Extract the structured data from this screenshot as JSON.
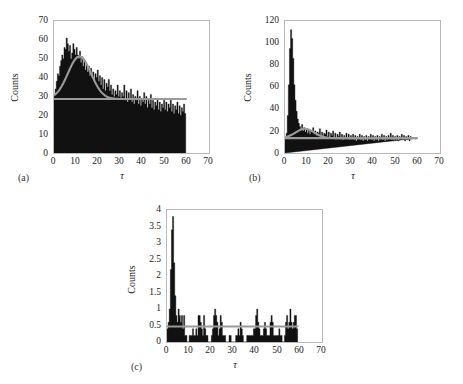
{
  "figure": {
    "background": "#ffffff",
    "fit_color": "#9a9a9a",
    "hist_color": "#111111",
    "axis_color": "#b9b9b9"
  },
  "panels": [
    {
      "id": "a",
      "label": "(a)",
      "ylabel": "Counts",
      "xlabel": "τ",
      "yticks": [
        "0",
        "10",
        "20",
        "30",
        "40",
        "50",
        "60",
        "70"
      ],
      "xticks": [
        "0",
        "10",
        "20",
        "30",
        "40",
        "50",
        "60",
        "70"
      ]
    },
    {
      "id": "b",
      "label": "(b)",
      "ylabel": "Counts",
      "xlabel": "τ",
      "yticks": [
        "0",
        "20",
        "40",
        "60",
        "80",
        "100",
        "120"
      ],
      "xticks": [
        "0",
        "10",
        "20",
        "30",
        "40",
        "50",
        "60",
        "70"
      ]
    },
    {
      "id": "c",
      "label": "(c)",
      "ylabel": "Counts",
      "xlabel": "τ",
      "yticks": [
        "0",
        "0.5",
        "1",
        "1.5",
        "2",
        "2.5",
        "3",
        "3.5",
        "4"
      ],
      "xticks": [
        "0",
        "10",
        "20",
        "30",
        "40",
        "50",
        "60",
        "70"
      ]
    }
  ],
  "chart_data": [
    {
      "type": "bar",
      "panel": "a",
      "title": "",
      "xlabel": "τ",
      "ylabel": "Counts",
      "xlim": [
        0,
        70
      ],
      "ylim": [
        0,
        70
      ],
      "grid": false,
      "legend": "none",
      "data_x_max": 59.5,
      "bin_width": 0.5,
      "x": [
        0.25,
        0.75,
        1.25,
        1.75,
        2.25,
        2.75,
        3.25,
        3.75,
        4.25,
        4.75,
        5.25,
        5.75,
        6.25,
        6.75,
        7.25,
        7.75,
        8.25,
        8.75,
        9.25,
        9.75,
        10.25,
        10.75,
        11.25,
        11.75,
        12.25,
        12.75,
        13.25,
        13.75,
        14.25,
        14.75,
        15.25,
        15.75,
        16.25,
        16.75,
        17.25,
        17.75,
        18.25,
        18.75,
        19.25,
        19.75,
        20.25,
        20.75,
        21.25,
        21.75,
        22.25,
        22.75,
        23.25,
        23.75,
        24.25,
        24.75,
        25.25,
        25.75,
        26.25,
        26.75,
        27.25,
        27.75,
        28.25,
        28.75,
        29.25,
        29.75,
        30.25,
        30.75,
        31.25,
        31.75,
        32.25,
        32.75,
        33.25,
        33.75,
        34.25,
        34.75,
        35.25,
        35.75,
        36.25,
        36.75,
        37.25,
        37.75,
        38.25,
        38.75,
        39.25,
        39.75,
        40.25,
        40.75,
        41.25,
        41.75,
        42.25,
        42.75,
        43.25,
        43.75,
        44.25,
        44.75,
        45.25,
        45.75,
        46.25,
        46.75,
        47.25,
        47.75,
        48.25,
        48.75,
        49.25,
        49.75,
        50.25,
        50.75,
        51.25,
        51.75,
        52.25,
        52.75,
        53.25,
        53.75,
        54.25,
        54.75,
        55.25,
        55.75,
        56.25,
        56.75,
        57.25,
        57.75,
        58.25,
        58.75,
        59.25
      ],
      "values": [
        31,
        34,
        38,
        42,
        41,
        46,
        49,
        52,
        50,
        56,
        55,
        61,
        58,
        54,
        57,
        50,
        53,
        58,
        55,
        52,
        56,
        52,
        50,
        54,
        48,
        51,
        46,
        49,
        44,
        47,
        43,
        46,
        41,
        45,
        40,
        43,
        38,
        42,
        40,
        44,
        38,
        41,
        36,
        40,
        34,
        39,
        33,
        37,
        35,
        39,
        33,
        36,
        31,
        34,
        30,
        33,
        31,
        36,
        30,
        33,
        29,
        32,
        30,
        36,
        28,
        33,
        27,
        32,
        29,
        34,
        27,
        31,
        26,
        30,
        28,
        33,
        26,
        30,
        25,
        29,
        27,
        32,
        26,
        30,
        24,
        28,
        26,
        31,
        24,
        28,
        23,
        27,
        25,
        29,
        23,
        27,
        22,
        26,
        24,
        28,
        23,
        27,
        22,
        26,
        24,
        28,
        22,
        26,
        21,
        25,
        23,
        27,
        21,
        25,
        20,
        24,
        22,
        26,
        21
      ],
      "overlay_curves": [
        {
          "name": "gaussian-plus-baseline-fit",
          "color": "#9a9a9a",
          "form": "baseline + gaussian",
          "baseline": 28.6,
          "amplitude": 22.6,
          "center": 11.5,
          "sigma": 5.2
        },
        {
          "name": "baseline-level",
          "color": "#9a9a9a",
          "form": "constant",
          "level": 28.6
        }
      ]
    },
    {
      "type": "bar",
      "panel": "b",
      "title": "",
      "xlabel": "τ",
      "ylabel": "Counts",
      "xlim": [
        0,
        70
      ],
      "ylim": [
        0,
        120
      ],
      "grid": false,
      "legend": "none",
      "data_x_max": 59.5,
      "bin_width": 0.5,
      "x": [
        0.25,
        0.75,
        1.25,
        1.75,
        2.25,
        2.75,
        3.25,
        3.75,
        4.25,
        4.75,
        5.25,
        5.75,
        6.25,
        6.75,
        7.25,
        7.75,
        8.25,
        8.75,
        9.25,
        9.75,
        10.25,
        10.75,
        11.25,
        11.75,
        12.25,
        12.75,
        13.25,
        13.75,
        14.25,
        14.75,
        15.25,
        15.75,
        16.25,
        16.75,
        17.25,
        17.75,
        18.25,
        18.75,
        19.25,
        19.75,
        20.25,
        20.75,
        21.25,
        21.75,
        22.25,
        22.75,
        23.25,
        23.75,
        24.25,
        24.75,
        25.25,
        25.75,
        26.25,
        26.75,
        27.25,
        27.75,
        28.25,
        28.75,
        29.25,
        29.75,
        30.25,
        30.75,
        31.25,
        31.75,
        32.25,
        32.75,
        33.25,
        33.75,
        34.25,
        34.75,
        35.25,
        35.75,
        36.25,
        36.75,
        37.25,
        37.75,
        38.25,
        38.75,
        39.25,
        39.75,
        40.25,
        40.75,
        41.25,
        41.75,
        42.25,
        42.75,
        43.25,
        43.75,
        44.25,
        44.75,
        45.25,
        45.75,
        46.25,
        46.75,
        47.25,
        47.75,
        48.25,
        48.75,
        49.25,
        49.75,
        50.25,
        50.75,
        51.25,
        51.75,
        52.25,
        52.75,
        53.25,
        53.75,
        54.25,
        54.75,
        55.25,
        55.75,
        56.25,
        56.75,
        57.25,
        57.75,
        58.25,
        58.75,
        59.25
      ],
      "values": [
        14,
        18,
        34,
        62,
        95,
        112,
        104,
        86,
        62,
        48,
        38,
        31,
        27,
        24,
        21,
        26,
        20,
        23,
        19,
        22,
        18,
        21,
        17,
        20,
        19,
        23,
        17,
        20,
        16,
        19,
        18,
        22,
        16,
        19,
        15,
        18,
        17,
        21,
        15,
        19,
        14,
        18,
        16,
        20,
        14,
        18,
        13,
        17,
        15,
        19,
        13,
        17,
        12,
        16,
        14,
        18,
        13,
        17,
        12,
        16,
        13,
        17,
        12,
        16,
        11,
        15,
        13,
        17,
        12,
        16,
        11,
        15,
        12,
        16,
        11,
        15,
        13,
        17,
        12,
        16,
        11,
        15,
        12,
        16,
        11,
        15,
        13,
        17,
        12,
        16,
        11,
        15,
        12,
        16,
        14,
        18,
        12,
        16,
        11,
        15,
        12,
        16,
        11,
        15,
        13,
        17,
        12,
        16,
        11,
        15,
        12,
        16,
        11,
        15,
        13
      ],
      "overlay_curves": [
        {
          "name": "broad-bump-plus-baseline-fit",
          "color": "#9a9a9a",
          "form": "baseline + gaussian",
          "baseline": 13.5,
          "amplitude": 8.5,
          "center": 9.0,
          "sigma": 4.2
        },
        {
          "name": "baseline-level",
          "color": "#9a9a9a",
          "form": "constant",
          "level": 13.5
        }
      ]
    },
    {
      "type": "bar",
      "panel": "c",
      "title": "",
      "xlabel": "τ",
      "ylabel": "Counts",
      "xlim": [
        0,
        70
      ],
      "ylim": [
        0,
        4
      ],
      "grid": false,
      "legend": "none",
      "data_x_max": 59,
      "bin_width": 0.5,
      "x": [
        0.25,
        0.75,
        1.25,
        1.75,
        2.25,
        2.75,
        3.25,
        3.75,
        4.25,
        4.75,
        5.25,
        5.75,
        6.25,
        6.75,
        7.25,
        7.75,
        8.25,
        8.75,
        9.25,
        9.75,
        10.25,
        10.75,
        11.25,
        11.75,
        12.25,
        12.75,
        13.25,
        13.75,
        14.25,
        14.75,
        15.25,
        15.75,
        16.25,
        16.75,
        17.25,
        17.75,
        18.25,
        18.75,
        19.25,
        19.75,
        20.25,
        20.75,
        21.25,
        21.75,
        22.25,
        22.75,
        23.25,
        23.75,
        24.25,
        24.75,
        25.25,
        25.75,
        26.25,
        26.75,
        27.25,
        27.75,
        28.25,
        28.75,
        29.25,
        29.75,
        30.25,
        30.75,
        31.25,
        31.75,
        32.25,
        32.75,
        33.25,
        33.75,
        34.25,
        34.75,
        35.25,
        35.75,
        36.25,
        36.75,
        37.25,
        37.75,
        38.25,
        38.75,
        39.25,
        39.75,
        40.25,
        40.75,
        41.25,
        41.75,
        42.25,
        42.75,
        43.25,
        43.75,
        44.25,
        44.75,
        45.25,
        45.75,
        46.25,
        46.75,
        47.25,
        47.75,
        48.25,
        48.75,
        49.25,
        49.75,
        50.25,
        50.75,
        51.25,
        51.75,
        52.25,
        52.75,
        53.25,
        53.75,
        54.25,
        54.75,
        55.25,
        55.75,
        56.25,
        56.75,
        57.25,
        57.75,
        58.25,
        58.75
      ],
      "values": [
        0.4,
        0.6,
        1.0,
        2.2,
        3.4,
        3.8,
        2.4,
        1.4,
        0.8,
        0.6,
        1.0,
        0.8,
        0.6,
        0.8,
        0.4,
        0.8,
        0.2,
        0.2,
        0.0,
        0.0,
        0.2,
        0.2,
        0.2,
        0.4,
        0.2,
        0.2,
        0.4,
        0.2,
        0.8,
        0.8,
        0.6,
        0.4,
        0.2,
        0.8,
        0.4,
        0.2,
        0.2,
        0.0,
        0.0,
        0.0,
        0.2,
        0.4,
        0.8,
        1.0,
        0.8,
        0.6,
        0.2,
        0.4,
        0.8,
        0.6,
        0.2,
        0.2,
        0.2,
        0.0,
        0.0,
        0.0,
        0.2,
        0.2,
        0.0,
        0.0,
        0.0,
        0.0,
        0.2,
        0.2,
        0.4,
        0.2,
        0.6,
        0.4,
        0.2,
        0.0,
        0.0,
        0.0,
        0.2,
        0.2,
        0.2,
        0.2,
        0.2,
        0.2,
        0.4,
        0.4,
        0.8,
        1.0,
        0.6,
        0.4,
        0.2,
        0.2,
        0.2,
        0.4,
        0.6,
        0.4,
        0.2,
        0.2,
        0.2,
        0.6,
        0.8,
        0.6,
        0.2,
        0.2,
        0.2,
        0.2,
        0.2,
        0.4,
        0.2,
        0.2,
        0.0,
        0.0,
        0.2,
        0.6,
        0.8,
        0.4,
        0.6,
        1.0,
        0.6,
        0.4,
        0.6,
        0.8,
        0.8,
        0.4
      ],
      "overlay_curves": [
        {
          "name": "baseline-level",
          "color": "#9a9a9a",
          "form": "constant",
          "level": 0.47
        }
      ]
    }
  ]
}
